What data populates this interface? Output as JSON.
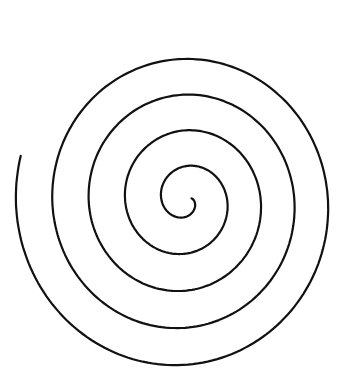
{
  "image": {
    "width": 345,
    "height": 378,
    "background": "#ffffff",
    "subject": "hand-drawn spiral"
  },
  "spiral": {
    "stroke_color": "#111111",
    "stroke_width": 2.2,
    "center": [
      187,
      200
    ],
    "inner_end": [
      192,
      198
    ],
    "outer_end": [
      255,
      35
    ],
    "turns": 4.6,
    "arm_spacing_px": 35,
    "direction": "counter-clockwise outward"
  }
}
